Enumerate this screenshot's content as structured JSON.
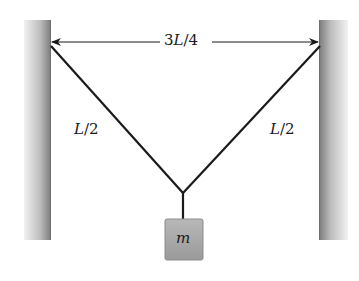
{
  "diagram": {
    "type": "physics-statics",
    "dimension_label": {
      "prefix": "3",
      "var": "L",
      "suffix": "/4"
    },
    "left_string_label": {
      "var": "L",
      "suffix": "/2"
    },
    "right_string_label": {
      "var": "L",
      "suffix": "/2"
    },
    "mass_label": "m",
    "colors": {
      "wall_dark": "#8a8a8a",
      "wall_light": "#e6e6e6",
      "string": "#1a1a1a",
      "mass_fill": "#a9a9a9",
      "mass_edge": "#8c8c8c"
    }
  }
}
